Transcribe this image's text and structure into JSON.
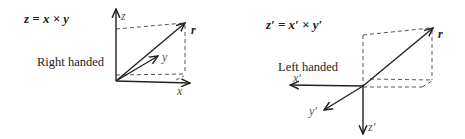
{
  "right_panel": {
    "equation": "z = x × y",
    "caption": "Right handed",
    "axes": {
      "x": "x",
      "y": "y",
      "z": "z"
    },
    "vector": "r"
  },
  "left_panel": {
    "equation": "z′ = x′ × y′",
    "caption": "Left handed",
    "axes": {
      "x": "x′",
      "y": "y′",
      "z": "z′"
    },
    "vector": "r"
  },
  "colors": {
    "line": "#222222",
    "dashed": "#444444",
    "axis_label": "#555555",
    "background": "#ffffff"
  }
}
